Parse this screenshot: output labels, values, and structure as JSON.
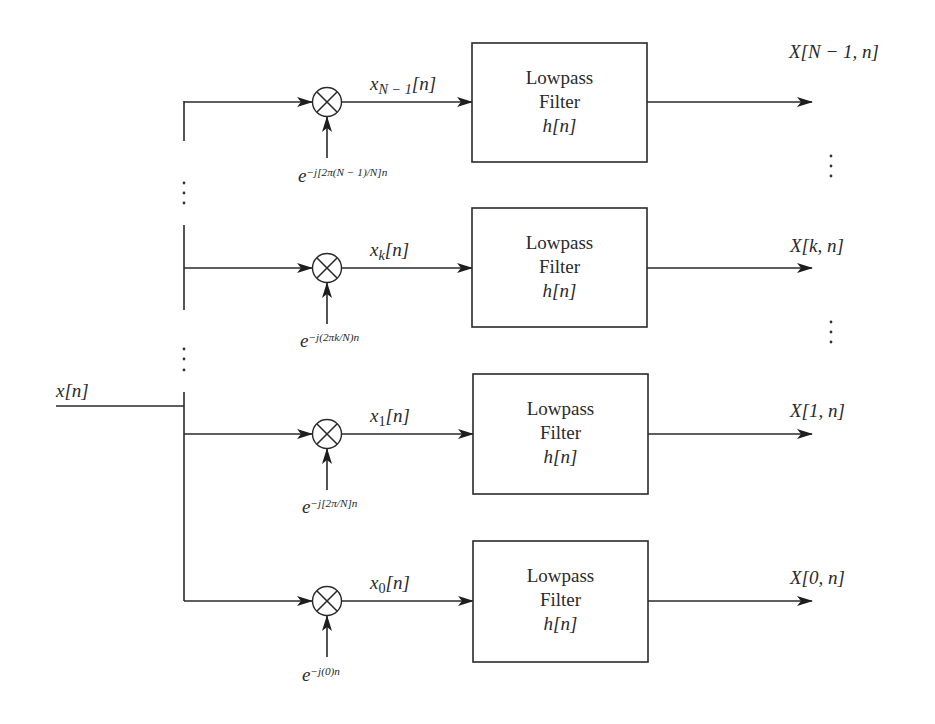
{
  "input": {
    "label": "x[n]"
  },
  "filter": {
    "line1": "Lowpass",
    "line2": "Filter",
    "line3": "h[n]"
  },
  "channels": [
    {
      "id": "N-1",
      "signal_base": "x",
      "signal_sub": "N − 1",
      "signal_tail": "[n]",
      "osc_base": "e",
      "osc_exp": "−j[2π(N − 1)/N]n",
      "output": "X[N − 1, n]"
    },
    {
      "id": "k",
      "signal_base": "x",
      "signal_sub": "k",
      "signal_tail": "[n]",
      "osc_base": "e",
      "osc_exp": "−j(2πk/N)n",
      "output": "X[k, n]"
    },
    {
      "id": "1",
      "signal_base": "x",
      "signal_sub": "1",
      "signal_tail": "[n]",
      "osc_base": "e",
      "osc_exp": "−j[2π/N]n",
      "output": "X[1, n]"
    },
    {
      "id": "0",
      "signal_base": "x",
      "signal_sub": "0",
      "signal_tail": "[n]",
      "osc_base": "e",
      "osc_exp": "−j(0)n",
      "output": "X[0, n]"
    }
  ],
  "symbols": {
    "multiplier": "⊗",
    "ellipsis": "⋮"
  }
}
